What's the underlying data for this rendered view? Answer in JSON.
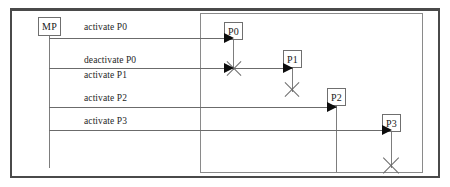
{
  "diagram": {
    "type": "uml-sequence-diagram",
    "title": "",
    "frame": {
      "border_color": "#4a4a4a",
      "background": "#ffffff"
    },
    "inner_frame": {
      "border_color": "#8a8a8a"
    },
    "line_color": "#6b6b6b",
    "arrow_color": "#0d0d0d",
    "participants": [
      {
        "id": "mp",
        "label": "MP",
        "x": 38,
        "y": 17,
        "w": 23,
        "h": 19,
        "lifeline_to": 168,
        "destroyed": false
      },
      {
        "id": "p0",
        "label": "P0",
        "x": 224,
        "y": 22,
        "w": 19,
        "h": 18,
        "lifeline_to": 70,
        "destroyed": true
      },
      {
        "id": "p1",
        "label": "P1",
        "x": 283,
        "y": 50,
        "w": 19,
        "h": 18,
        "lifeline_to": 92,
        "destroyed": true
      },
      {
        "id": "p2",
        "label": "P2",
        "x": 327,
        "y": 88,
        "w": 19,
        "h": 18,
        "lifeline_to": 172,
        "destroyed": false
      },
      {
        "id": "p3",
        "label": "P3",
        "x": 382,
        "y": 114,
        "w": 19,
        "h": 18,
        "lifeline_to": 168,
        "destroyed": true
      }
    ],
    "messages": [
      {
        "id": "m0",
        "label": "activate P0",
        "from": "mp",
        "to": "p0",
        "y": 38,
        "label_x": 84,
        "label_y": 22
      },
      {
        "id": "m1",
        "label": "deactivate P0",
        "from": "mp",
        "to": "p0",
        "y": 68,
        "label_x": 84,
        "label_y": 55
      },
      {
        "id": "m2",
        "label": "activate P1",
        "from": "mp",
        "to": "p1",
        "y": 68,
        "label_x": 84,
        "label_y": 68
      },
      {
        "id": "m3",
        "label": "activate P2",
        "from": "mp",
        "to": "p2",
        "y": 107,
        "label_x": 84,
        "label_y": 92
      },
      {
        "id": "m4",
        "label": "activate P3",
        "from": "mp",
        "to": "p3",
        "y": 130,
        "label_x": 84,
        "label_y": 115
      }
    ],
    "destruction_markers": [
      {
        "id": "x-p0",
        "on": "p0",
        "cx": 234,
        "cy": 68,
        "size": 20
      },
      {
        "id": "x-p1",
        "on": "p1",
        "cx": 292,
        "cy": 89,
        "size": 20
      },
      {
        "id": "x-p3",
        "on": "p3",
        "cx": 391,
        "cy": 165,
        "size": 22
      }
    ]
  }
}
